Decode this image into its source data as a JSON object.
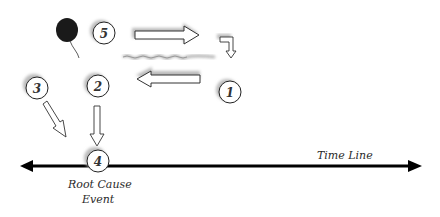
{
  "diagram": {
    "timeline_label": "Time Line",
    "root_cause_label_line1": "Root Cause",
    "root_cause_label_line2": "Event",
    "nodes": [
      {
        "id": "1",
        "label": "1"
      },
      {
        "id": "2",
        "label": "2"
      },
      {
        "id": "3",
        "label": "3"
      },
      {
        "id": "4",
        "label": "4"
      },
      {
        "id": "5",
        "label": "5"
      }
    ],
    "icons": [
      "balloon-icon"
    ],
    "colors": {
      "line": "#000000",
      "circle_stroke": "#222222",
      "shadow": "#b8b8b8",
      "balloon": "#1a1a1a"
    }
  }
}
